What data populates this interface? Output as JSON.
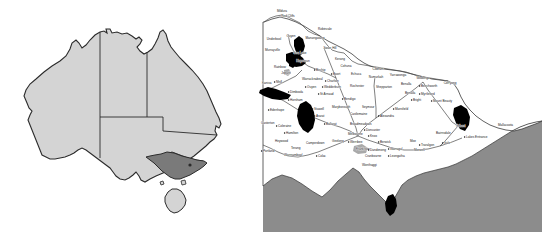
{
  "figure": {
    "title": "",
    "panels": [
      {
        "name": "australia-locator-map",
        "caption": ""
      },
      {
        "name": "victoria-detail-map",
        "caption": ""
      }
    ]
  },
  "colors": {
    "land_light": "#d4d4d4",
    "land_highlight": "#7a7a7a",
    "ocean": "#8c8c8c",
    "outline": "#2b2b2b",
    "shaded_region": "#000000",
    "background": "#ffffff",
    "label_text": "#1a1a1a"
  },
  "australia_map": {
    "highlighted_state": "Victoria",
    "states": [
      "Western Australia",
      "Northern Territory",
      "Queensland",
      "South Australia",
      "New South Wales",
      "Victoria",
      "Tasmania"
    ]
  },
  "victoria_map": {
    "water_label": "",
    "towns": [
      {
        "name": "Mildura",
        "x": 24,
        "y": 12,
        "anchor": "mid",
        "dot": false
      },
      {
        "name": "Red Cliffs",
        "x": 30,
        "y": 17,
        "anchor": "mid",
        "dot": false
      },
      {
        "name": "Robinvale",
        "x": 60,
        "y": 30,
        "anchor": "start",
        "dot": false
      },
      {
        "name": "Ouyen",
        "x": 33,
        "y": 37,
        "anchor": "mid",
        "dot": false
      },
      {
        "name": "Manangatang",
        "x": 57,
        "y": 39,
        "anchor": "mid",
        "dot": false
      },
      {
        "name": "Underbool",
        "x": 16,
        "y": 40,
        "anchor": "mid",
        "dot": false
      },
      {
        "name": "Murrayville",
        "x": 7,
        "y": 51,
        "anchor": "start",
        "dot": false
      },
      {
        "name": "Sea Lake",
        "x": 42,
        "y": 54,
        "anchor": "mid",
        "dot": false
      },
      {
        "name": "Swan Hill",
        "x": 72,
        "y": 49,
        "anchor": "mid",
        "dot": false
      },
      {
        "name": "Hopetoun",
        "x": 45,
        "y": 62,
        "anchor": "mid",
        "dot": true
      },
      {
        "name": "Kerang",
        "x": 82,
        "y": 60,
        "anchor": "mid",
        "dot": false
      },
      {
        "name": "Rainbow",
        "x": 22,
        "y": 68,
        "anchor": "mid",
        "dot": false
      },
      {
        "name": "Cohuna",
        "x": 88,
        "y": 67,
        "anchor": "mid",
        "dot": false
      },
      {
        "name": "Jeparit",
        "x": 28,
        "y": 74,
        "anchor": "mid",
        "dot": true
      },
      {
        "name": "Birchip",
        "x": 58,
        "y": 71,
        "anchor": "start",
        "dot": true
      },
      {
        "name": "Boort",
        "x": 75,
        "y": 75,
        "anchor": "start",
        "dot": true
      },
      {
        "name": "Echuca",
        "x": 93,
        "y": 75,
        "anchor": "start",
        "dot": false
      },
      {
        "name": "Cobram",
        "x": 120,
        "y": 70,
        "anchor": "mid",
        "dot": false
      },
      {
        "name": "Numurkah",
        "x": 118,
        "y": 78,
        "anchor": "mid",
        "dot": false
      },
      {
        "name": "Yarrawonga",
        "x": 140,
        "y": 76,
        "anchor": "mid",
        "dot": false
      },
      {
        "name": "Wodonga",
        "x": 165,
        "y": 79,
        "anchor": "mid",
        "dot": false
      },
      {
        "name": "Nhill",
        "x": 18,
        "y": 83,
        "anchor": "start",
        "dot": true
      },
      {
        "name": "Warracknabeal",
        "x": 44,
        "y": 80,
        "anchor": "start",
        "dot": false
      },
      {
        "name": "Charlton",
        "x": 69,
        "y": 82,
        "anchor": "start",
        "dot": true
      },
      {
        "name": "Kaniva",
        "x": 4,
        "y": 84,
        "anchor": "start",
        "dot": false
      },
      {
        "name": "Ouyen",
        "x": 49,
        "y": 88,
        "anchor": "start",
        "dot": true
      },
      {
        "name": "Wedderburn",
        "x": 66,
        "y": 88,
        "anchor": "start",
        "dot": true
      },
      {
        "name": "Rochester",
        "x": 92,
        "y": 87,
        "anchor": "start",
        "dot": false
      },
      {
        "name": "Shepparton",
        "x": 118,
        "y": 88,
        "anchor": "start",
        "dot": false
      },
      {
        "name": "Benalla",
        "x": 143,
        "y": 85,
        "anchor": "start",
        "dot": false
      },
      {
        "name": "Beechworth",
        "x": 163,
        "y": 87,
        "anchor": "start",
        "dot": true
      },
      {
        "name": "Corryong",
        "x": 192,
        "y": 84,
        "anchor": "mid",
        "dot": false
      },
      {
        "name": "Dimboola",
        "x": 32,
        "y": 93,
        "anchor": "start",
        "dot": true
      },
      {
        "name": "St Arnaud",
        "x": 62,
        "y": 95,
        "anchor": "start",
        "dot": true
      },
      {
        "name": "Benalla",
        "x": 147,
        "y": 94,
        "anchor": "start",
        "dot": false
      },
      {
        "name": "Myrtleford",
        "x": 163,
        "y": 95,
        "anchor": "start",
        "dot": true
      },
      {
        "name": "Horsham",
        "x": 32,
        "y": 101,
        "anchor": "start",
        "dot": true
      },
      {
        "name": "Bendigo",
        "x": 86,
        "y": 100,
        "anchor": "start",
        "dot": true
      },
      {
        "name": "Bright",
        "x": 155,
        "y": 101,
        "anchor": "start",
        "dot": true
      },
      {
        "name": "Mount Beauty",
        "x": 175,
        "y": 102,
        "anchor": "start",
        "dot": true
      },
      {
        "name": "Edenhope",
        "x": 12,
        "y": 111,
        "anchor": "start",
        "dot": true
      },
      {
        "name": "Stawell",
        "x": 56,
        "y": 110,
        "anchor": "start",
        "dot": true
      },
      {
        "name": "Maryborough",
        "x": 74,
        "y": 108,
        "anchor": "start",
        "dot": false
      },
      {
        "name": "Seymour",
        "x": 104,
        "y": 108,
        "anchor": "start",
        "dot": false
      },
      {
        "name": "Mansfield",
        "x": 137,
        "y": 110,
        "anchor": "start",
        "dot": true
      },
      {
        "name": "Castlemaine",
        "x": 92,
        "y": 115,
        "anchor": "start",
        "dot": false
      },
      {
        "name": "Ararat",
        "x": 58,
        "y": 117,
        "anchor": "start",
        "dot": true
      },
      {
        "name": "Alexandra",
        "x": 122,
        "y": 117,
        "anchor": "start",
        "dot": true
      },
      {
        "name": "Casterton",
        "x": 3,
        "y": 124,
        "anchor": "start",
        "dot": false
      },
      {
        "name": "Ballarat",
        "x": 68,
        "y": 125,
        "anchor": "start",
        "dot": true
      },
      {
        "name": "Broadmeadows",
        "x": 92,
        "y": 125,
        "anchor": "start",
        "dot": false
      },
      {
        "name": "Coleraine",
        "x": 20,
        "y": 127,
        "anchor": "start",
        "dot": true
      },
      {
        "name": "Orbost",
        "x": 198,
        "y": 127,
        "anchor": "start",
        "dot": false
      },
      {
        "name": "Mallacoota",
        "x": 240,
        "y": 126,
        "anchor": "start",
        "dot": false
      },
      {
        "name": "Doncaster",
        "x": 108,
        "y": 131,
        "anchor": "start",
        "dot": true
      },
      {
        "name": "Hamilton",
        "x": 28,
        "y": 134,
        "anchor": "start",
        "dot": true
      },
      {
        "name": "Melbourne",
        "x": 90,
        "y": 135,
        "anchor": "start",
        "dot": false
      },
      {
        "name": "Bairnsdale",
        "x": 178,
        "y": 134,
        "anchor": "start",
        "dot": false
      },
      {
        "name": "Lakes Entrance",
        "x": 208,
        "y": 138,
        "anchor": "start",
        "dot": true
      },
      {
        "name": "Heywood",
        "x": 17,
        "y": 142,
        "anchor": "start",
        "dot": false
      },
      {
        "name": "Geelong",
        "x": 74,
        "y": 142,
        "anchor": "start",
        "dot": false
      },
      {
        "name": "Werribee",
        "x": 92,
        "y": 143,
        "anchor": "start",
        "dot": true
      },
      {
        "name": "Knox",
        "x": 112,
        "y": 137,
        "anchor": "start",
        "dot": true
      },
      {
        "name": "Berwick",
        "x": 122,
        "y": 143,
        "anchor": "start",
        "dot": true
      },
      {
        "name": "Moe",
        "x": 152,
        "y": 142,
        "anchor": "start",
        "dot": false
      },
      {
        "name": "Traralgon",
        "x": 163,
        "y": 146,
        "anchor": "start",
        "dot": true
      },
      {
        "name": "Sale",
        "x": 186,
        "y": 144,
        "anchor": "start",
        "dot": true
      },
      {
        "name": "Camperdown",
        "x": 48,
        "y": 144,
        "anchor": "start",
        "dot": false
      },
      {
        "name": "Terang",
        "x": 33,
        "y": 149,
        "anchor": "start",
        "dot": false
      },
      {
        "name": "Frankston",
        "x": 98,
        "y": 150,
        "anchor": "start",
        "dot": false
      },
      {
        "name": "Dandenong",
        "x": 112,
        "y": 151,
        "anchor": "start",
        "dot": true
      },
      {
        "name": "Warragul",
        "x": 132,
        "y": 150,
        "anchor": "start",
        "dot": true
      },
      {
        "name": "Morwell",
        "x": 156,
        "y": 151,
        "anchor": "start",
        "dot": false
      },
      {
        "name": "Portland",
        "x": 5,
        "y": 152,
        "anchor": "start",
        "dot": true
      },
      {
        "name": "Warrnambool",
        "x": 26,
        "y": 156,
        "anchor": "start",
        "dot": false
      },
      {
        "name": "Colac",
        "x": 60,
        "y": 157,
        "anchor": "start",
        "dot": true
      },
      {
        "name": "Cranbourne",
        "x": 107,
        "y": 157,
        "anchor": "start",
        "dot": false
      },
      {
        "name": "Leongatha",
        "x": 132,
        "y": 157,
        "anchor": "start",
        "dot": true
      },
      {
        "name": "Wonthaggi",
        "x": 104,
        "y": 166,
        "anchor": "start",
        "dot": false
      }
    ]
  }
}
